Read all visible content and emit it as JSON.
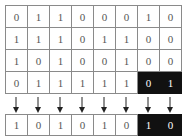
{
  "matrix": {
    "rows": [
      [
        "0",
        "1",
        "1",
        "0",
        "0",
        "0",
        "1",
        "0"
      ],
      [
        "1",
        "1",
        "1",
        "0",
        "1",
        "1",
        "0",
        "0"
      ],
      [
        "1",
        "0",
        "1",
        "0",
        "0",
        "1",
        "0",
        "0"
      ],
      [
        "0",
        "1",
        "1",
        "1",
        "1",
        "1",
        "0",
        "1"
      ]
    ],
    "highlighted_cells": [
      [
        3,
        6
      ],
      [
        3,
        7
      ]
    ]
  },
  "result": {
    "row": [
      "1",
      "0",
      "1",
      "0",
      "1",
      "0",
      "1",
      "0"
    ],
    "highlighted_cells": [
      6,
      7
    ]
  },
  "arrows": {
    "count": 8,
    "direction": "down"
  },
  "colors": {
    "highlight_bg": "#111111",
    "highlight_text": "#ffffff",
    "border": "#8a8a8a",
    "text": "#555555"
  }
}
